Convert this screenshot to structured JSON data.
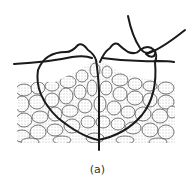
{
  "figure": {
    "caption": "(a)",
    "colors": {
      "suture": "#1a1a1a",
      "tissue_outline": "#555555",
      "tissue_fill": "#d9d9d9",
      "stipple": "#777777",
      "background": "#ffffff"
    }
  }
}
